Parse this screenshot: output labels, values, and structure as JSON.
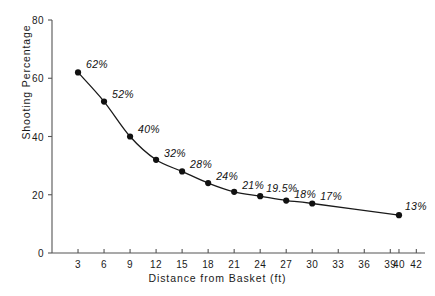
{
  "chart_data": {
    "type": "line",
    "title": "",
    "subtitle": "",
    "xlabel": "Distance from Basket (ft)",
    "ylabel": "Shooting Percentage",
    "xlim": [
      0,
      43
    ],
    "ylim": [
      0,
      80
    ],
    "grid": false,
    "legend": "none",
    "marker": "filled-circle",
    "x": [
      3,
      6,
      9,
      12,
      15,
      18,
      21,
      24,
      27,
      30,
      40
    ],
    "values": [
      62,
      52,
      40,
      32,
      28,
      24,
      21,
      19.5,
      18,
      17,
      13
    ],
    "point_labels": [
      "62%",
      "52%",
      "40%",
      "32%",
      "28%",
      "24%",
      "21%",
      "19.5%",
      "18%",
      "17%",
      "13%"
    ],
    "xticks": [
      3,
      6,
      9,
      12,
      15,
      18,
      21,
      24,
      27,
      30,
      33,
      36,
      39,
      40,
      42
    ],
    "xtick_labels": [
      "3",
      "6",
      "9",
      "12",
      "15",
      "18",
      "21",
      "24",
      "27",
      "30",
      "33",
      "36",
      "39",
      "40",
      "42"
    ],
    "yticks": [
      0,
      20,
      40,
      60,
      80
    ],
    "ytick_labels": [
      "0",
      "20",
      "40",
      "60",
      "80"
    ],
    "line_color": "#1a1a1a",
    "marker_color": "#111111",
    "axis_color": "#555555",
    "background_color": "#ffffff"
  },
  "axes": {
    "x_title": "Distance from Basket (ft)",
    "y_title": "Shooting Percentage"
  }
}
